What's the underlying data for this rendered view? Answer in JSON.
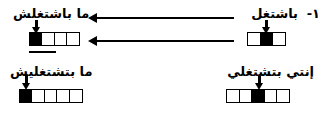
{
  "figure": {
    "index_label": "١-",
    "background_color": "#ffffff",
    "ink_color": "#000000"
  },
  "items": {
    "source_masculine": {
      "text": "باشتغل",
      "slots": 3,
      "filled_index": 1
    },
    "target_masculine_negative": {
      "text": "ما باشتغلش",
      "slots": 4,
      "filled_index": 0
    },
    "source_feminine": {
      "text": "إنتي بتشتغلي",
      "slots": 5,
      "filled_index": 2
    },
    "target_feminine_negative": {
      "text": "ما بتشتغليش",
      "slots": 5,
      "filled_index": 0
    }
  },
  "arrows": {
    "top_derivation": "left-arrow",
    "bottom_derivation": "left-arrow",
    "stress_pointer": "down-arrow"
  }
}
